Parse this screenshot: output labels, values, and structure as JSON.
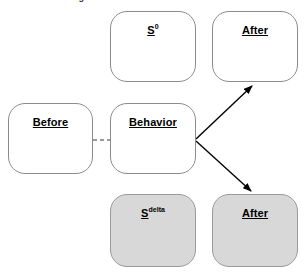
{
  "diagram": {
    "title_cropped": "Figure: Before / Behavior / After states",
    "background_color": "#ffffff",
    "shaded_fill_color": "#d8d8d8",
    "node_border_color": "#8c8c8c",
    "arrow_color": "#000000",
    "dashed_link_color": "#9a9a9a",
    "nodes": [
      {
        "id": "s0",
        "label": "S",
        "superscript": "0",
        "style": "white",
        "x": 110,
        "y": 11,
        "w": 86,
        "h": 71
      },
      {
        "id": "after_top",
        "label": "After",
        "superscript": "",
        "style": "white",
        "x": 212,
        "y": 11,
        "w": 86,
        "h": 71
      },
      {
        "id": "before",
        "label": "Before",
        "superscript": "",
        "style": "white",
        "x": 8,
        "y": 103,
        "w": 85,
        "h": 71
      },
      {
        "id": "behavior",
        "label": "Behavior",
        "superscript": "",
        "style": "white",
        "x": 110,
        "y": 103,
        "w": 86,
        "h": 71
      },
      {
        "id": "s_delta",
        "label": "S",
        "superscript": "delta",
        "style": "shaded",
        "x": 110,
        "y": 194,
        "w": 86,
        "h": 73
      },
      {
        "id": "after_bottom",
        "label": "After",
        "superscript": "",
        "style": "shaded",
        "x": 212,
        "y": 194,
        "w": 86,
        "h": 73
      }
    ],
    "connectors": [
      {
        "id": "before-behavior-link",
        "kind": "dashed",
        "from": "before",
        "to": "behavior",
        "arrowhead": "none"
      },
      {
        "id": "behavior-to-after-top",
        "kind": "solid",
        "from": "behavior",
        "to": "after_top",
        "arrowhead": "end"
      },
      {
        "id": "behavior-to-after-bottom",
        "kind": "solid",
        "from": "behavior",
        "to": "after_bottom",
        "arrowhead": "end"
      }
    ]
  }
}
